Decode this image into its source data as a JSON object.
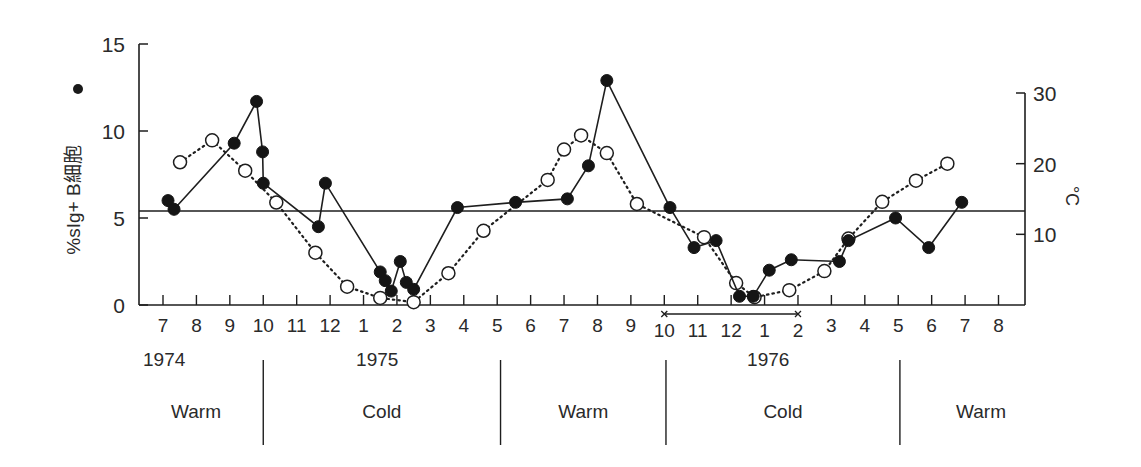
{
  "chart_data": {
    "type": "line",
    "title": "",
    "xlabel": "",
    "ylabel": "%sIg+ B細胞",
    "ylabel_marker": "filled-circle",
    "y2label": "°C",
    "ylim": [
      0,
      15
    ],
    "y2lim": [
      0,
      30
    ],
    "yticks": [
      "0",
      "5",
      "10",
      "15"
    ],
    "y2ticks": [
      "10",
      "20",
      "30"
    ],
    "x_month_ticks": [
      "7",
      "8",
      "9",
      "10",
      "11",
      "12",
      "1",
      "2",
      "3",
      "4",
      "5",
      "6",
      "7",
      "8",
      "9",
      "10",
      "11",
      "12",
      "1",
      "2",
      "3",
      "4",
      "5",
      "6",
      "7",
      "8"
    ],
    "year_labels": [
      {
        "label": "1974",
        "month_index": 0
      },
      {
        "label": "1975",
        "month_index": 6.5
      },
      {
        "label": "1976",
        "month_index": 18.2
      }
    ],
    "reference_line": {
      "value": 5.4,
      "axis": "left"
    },
    "bracket": {
      "from_month_index": 15,
      "to_month_index": 19,
      "note": "10 – 2"
    },
    "seasons": [
      {
        "label": "Warm",
        "from": -0.8,
        "to": 3
      },
      {
        "label": "Cold",
        "from": 3,
        "to": 10.1
      },
      {
        "label": "Warm",
        "from": 10.1,
        "to": 15.05
      },
      {
        "label": "Cold",
        "from": 15.05,
        "to": 22.05
      },
      {
        "label": "Warm",
        "from": 22.05,
        "to": 25.5
      }
    ],
    "series": [
      {
        "name": "%sIg+ B cells",
        "marker": "filled-circle",
        "line": "solid",
        "axis": "left",
        "x": [
          0.15,
          0.33,
          2.13,
          2.8,
          2.98,
          3.0,
          4.65,
          4.86,
          6.5,
          6.65,
          6.83,
          7.1,
          7.28,
          7.5,
          8.81,
          10.55,
          12.1,
          12.73,
          13.28,
          15.17,
          15.89,
          16.55,
          17.25,
          17.66,
          18.14,
          18.8,
          20.24,
          20.51,
          21.92,
          22.91,
          23.9
        ],
        "values": [
          6.0,
          5.5,
          9.3,
          11.7,
          8.8,
          7.0,
          4.5,
          7.0,
          1.9,
          1.4,
          0.8,
          2.5,
          1.3,
          0.9,
          5.6,
          5.9,
          6.1,
          8.0,
          12.9,
          5.6,
          3.3,
          3.7,
          0.5,
          0.5,
          2.0,
          2.6,
          2.5,
          3.7,
          5.0,
          3.3,
          5.9
        ]
      },
      {
        "name": "Water temperature (°C)",
        "marker": "open-circle",
        "line": "dotted",
        "axis": "right",
        "x": [
          0.51,
          1.47,
          2.46,
          3.39,
          4.56,
          5.51,
          6.5,
          7.5,
          8.54,
          9.59,
          11.51,
          12.0,
          12.51,
          13.28,
          14.18,
          16.19,
          17.15,
          17.7,
          18.74,
          19.79,
          20.51,
          21.52,
          22.53,
          23.47
        ],
        "values": [
          20.2,
          23.3,
          19.0,
          14.5,
          7.4,
          2.6,
          1.0,
          0.4,
          4.5,
          10.5,
          17.7,
          22.0,
          24.0,
          21.5,
          14.3,
          9.6,
          3.1,
          1.1,
          2.1,
          4.8,
          9.4,
          14.6,
          17.6,
          20.0
        ]
      }
    ],
    "legend": null,
    "grid": false
  }
}
